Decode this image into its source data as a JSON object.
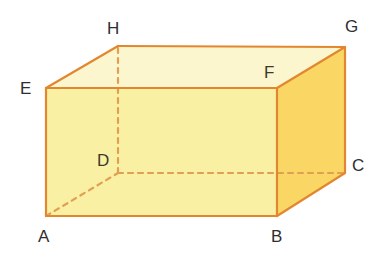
{
  "figure": {
    "name": "cuboid-abcdefgh",
    "kind": "rectangular-prism-diagram",
    "canvas": {
      "width": 381,
      "height": 261
    },
    "background_color": "#FFFFFF"
  },
  "colors": {
    "edge_visible": "#E2872F",
    "edge_hidden": "#E0A052",
    "face_top": "#FCF6CE",
    "face_front": "#FAF0A4",
    "face_right": "#FAD765",
    "label_text": "#2E2E30"
  },
  "style": {
    "visible_edge_width": 2.2,
    "hidden_edge_width": 2.2,
    "hidden_dash_pattern": "5,5"
  },
  "vertices": [
    {
      "id": "A",
      "label": "A",
      "x": 46,
      "y": 216,
      "hidden": false,
      "label_x": 38,
      "label_y": 228
    },
    {
      "id": "B",
      "label": "B",
      "x": 277,
      "y": 216,
      "hidden": false,
      "label_x": 271,
      "label_y": 228
    },
    {
      "id": "C",
      "label": "C",
      "x": 345,
      "y": 173,
      "hidden": false,
      "label_x": 352,
      "label_y": 157
    },
    {
      "id": "D",
      "label": "D",
      "x": 118,
      "y": 173,
      "hidden": true,
      "label_x": 97,
      "label_y": 152
    },
    {
      "id": "E",
      "label": "E",
      "x": 46,
      "y": 88,
      "hidden": false,
      "label_x": 20,
      "label_y": 80
    },
    {
      "id": "F",
      "label": "F",
      "x": 277,
      "y": 88,
      "hidden": false,
      "label_x": 264,
      "label_y": 64
    },
    {
      "id": "G",
      "label": "G",
      "x": 345,
      "y": 47,
      "hidden": false,
      "label_x": 345,
      "label_y": 18
    },
    {
      "id": "H",
      "label": "H",
      "x": 118,
      "y": 46,
      "hidden": false,
      "label_x": 107,
      "label_y": 20
    }
  ],
  "faces": [
    {
      "id": "face-top",
      "name": "EFGH",
      "points": "46,88 277,88 345,47 118,46",
      "fill": "#FCF6CE"
    },
    {
      "id": "face-front",
      "name": "ABFE",
      "points": "46,216 277,216 277,88 46,88",
      "fill": "#FAF0A4"
    },
    {
      "id": "face-right",
      "name": "BCGF",
      "points": "277,216 345,173 345,47 277,88",
      "fill": "#FAD765"
    }
  ],
  "edges": [
    {
      "id": "edge-AB",
      "from": "A",
      "to": "B",
      "hidden": false
    },
    {
      "id": "edge-BF",
      "from": "B",
      "to": "F",
      "hidden": false
    },
    {
      "id": "edge-FE",
      "from": "F",
      "to": "E",
      "hidden": false
    },
    {
      "id": "edge-EA",
      "from": "E",
      "to": "A",
      "hidden": false
    },
    {
      "id": "edge-BC",
      "from": "B",
      "to": "C",
      "hidden": false
    },
    {
      "id": "edge-CG",
      "from": "C",
      "to": "G",
      "hidden": false
    },
    {
      "id": "edge-GF",
      "from": "G",
      "to": "F",
      "hidden": false
    },
    {
      "id": "edge-GH",
      "from": "G",
      "to": "H",
      "hidden": false
    },
    {
      "id": "edge-HE",
      "from": "H",
      "to": "E",
      "hidden": false
    },
    {
      "id": "edge-AD",
      "from": "A",
      "to": "D",
      "hidden": true
    },
    {
      "id": "edge-DC",
      "from": "D",
      "to": "C",
      "hidden": true
    },
    {
      "id": "edge-DH",
      "from": "D",
      "to": "H",
      "hidden": true
    }
  ]
}
